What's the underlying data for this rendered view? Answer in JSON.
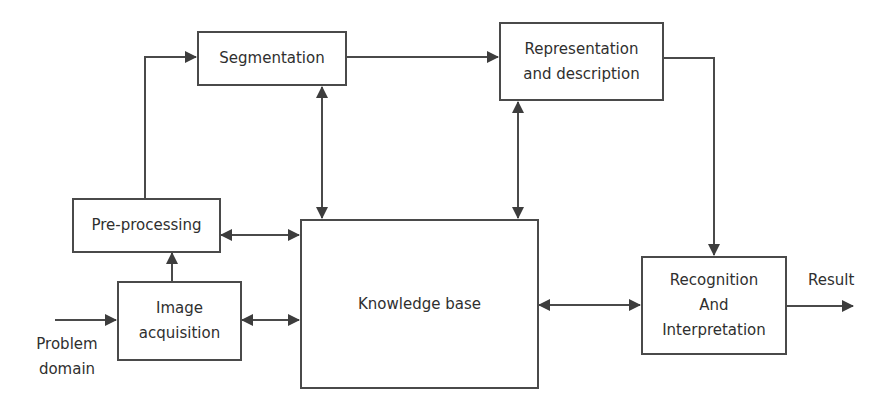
{
  "diagram": {
    "type": "block-diagram",
    "nodes": {
      "segmentation": {
        "lines": [
          "Segmentation"
        ]
      },
      "representation": {
        "lines": [
          "Representation",
          "and description"
        ]
      },
      "preprocessing": {
        "lines": [
          "Pre-processing"
        ]
      },
      "acquisition": {
        "lines": [
          "Image",
          "acquisition"
        ]
      },
      "knowledge": {
        "lines": [
          "Knowledge base"
        ]
      },
      "recognition": {
        "lines": [
          "Recognition",
          "And",
          "Interpretation"
        ]
      }
    },
    "labels": {
      "input": [
        "Problem",
        "domain"
      ],
      "output": "Result"
    },
    "edges": [
      {
        "from": "Problem domain",
        "to": "Image acquisition",
        "direction": "forward"
      },
      {
        "from": "Image acquisition",
        "to": "Pre-processing",
        "direction": "forward"
      },
      {
        "from": "Pre-processing",
        "to": "Segmentation",
        "direction": "forward"
      },
      {
        "from": "Segmentation",
        "to": "Representation and description",
        "direction": "forward"
      },
      {
        "from": "Representation and description",
        "to": "Recognition And Interpretation",
        "direction": "forward"
      },
      {
        "from": "Recognition And Interpretation",
        "to": "Result",
        "direction": "forward"
      },
      {
        "from": "Knowledge base",
        "to": "Segmentation",
        "direction": "bidirectional"
      },
      {
        "from": "Knowledge base",
        "to": "Representation and description",
        "direction": "bidirectional"
      },
      {
        "from": "Knowledge base",
        "to": "Pre-processing",
        "direction": "bidirectional"
      },
      {
        "from": "Knowledge base",
        "to": "Image acquisition",
        "direction": "bidirectional"
      },
      {
        "from": "Knowledge base",
        "to": "Recognition And Interpretation",
        "direction": "bidirectional"
      }
    ],
    "colors": {
      "stroke": "#4a4a4a",
      "text": "#2f2f2f",
      "background": "#ffffff"
    }
  }
}
